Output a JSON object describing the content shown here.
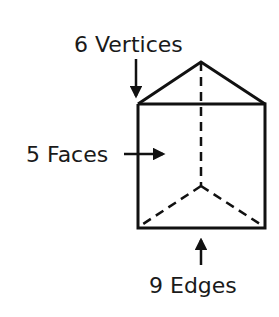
{
  "diagram": {
    "labels": {
      "vertices": "6 Vertices",
      "faces": "5 Faces",
      "edges": "9 Edges"
    },
    "counts": {
      "vertices": 6,
      "faces": 5,
      "edges": 9
    },
    "colors": {
      "stroke": "#111111",
      "background": "#ffffff"
    }
  }
}
